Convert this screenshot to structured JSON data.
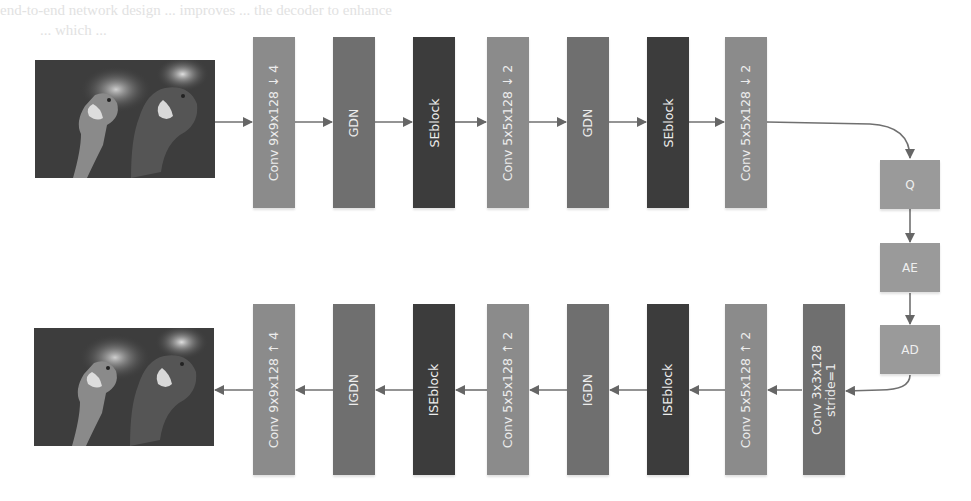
{
  "diagram": {
    "type": "neural-network-architecture",
    "colors": {
      "conv": "#8b8b8b",
      "gdn": "#6f6f6f",
      "seblock": "#3c3c3c",
      "entropy": "#9a9a9a",
      "arrow": "#666666"
    },
    "input_image": {
      "label": "input-parrots-image"
    },
    "output_image": {
      "label": "reconstructed-parrots-image"
    },
    "encoder": [
      {
        "label": "Conv 9x9x128 ↓ 4",
        "kind": "conv"
      },
      {
        "label": "GDN",
        "kind": "gdn"
      },
      {
        "label": "SEblock",
        "kind": "seblock"
      },
      {
        "label": "Conv 5x5x128 ↓ 2",
        "kind": "conv"
      },
      {
        "label": "GDN",
        "kind": "gdn"
      },
      {
        "label": "SEblock",
        "kind": "seblock"
      },
      {
        "label": "Conv 5x5x128 ↓ 2",
        "kind": "conv"
      }
    ],
    "entropy": [
      {
        "label": "Q"
      },
      {
        "label": "AE"
      },
      {
        "label": "AD"
      }
    ],
    "decoder": [
      {
        "label": "Conv 9x9x128 ↑ 4",
        "kind": "conv"
      },
      {
        "label": "IGDN",
        "kind": "gdn"
      },
      {
        "label": "ISEblock",
        "kind": "seblock"
      },
      {
        "label": "Conv 5x5x128 ↑ 2",
        "kind": "conv"
      },
      {
        "label": "IGDN",
        "kind": "gdn"
      },
      {
        "label": "ISEblock",
        "kind": "seblock"
      },
      {
        "label": "Conv 5x5x128 ↑ 2",
        "kind": "conv"
      },
      {
        "label": "Conv 3x3x128",
        "label2": "stride=1",
        "kind": "gdn"
      }
    ]
  },
  "background_text": {
    "line1": "end-to-end network design ... improves ... the decoder to enhance",
    "line2": "... which ..."
  }
}
